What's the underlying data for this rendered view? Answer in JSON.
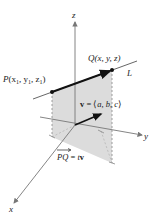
{
  "figure": {
    "axes": {
      "x_label": "x",
      "y_label": "y",
      "z_label": "z"
    },
    "points": {
      "P": {
        "name": "P",
        "coords": "(x",
        "sub1": "1",
        "comma_y": ", y",
        "sub2": "1",
        "comma_z": ", z",
        "sub3": "1",
        "close": ")"
      },
      "Q": {
        "label": "Q(x, y, z)"
      }
    },
    "line_label": "L",
    "vector_label": {
      "v": "v",
      "eq": " = ⟨",
      "a": "a",
      "b": "b",
      "c": "c",
      "sep": ", ",
      "close": "⟩"
    },
    "pq_label": {
      "pq": "PQ",
      "eq": " = ",
      "t": "t",
      "v": "v"
    },
    "colors": {
      "shade": "#d9d9d9",
      "axis": "#777777",
      "line": "#555555",
      "arrow": "#111111"
    }
  }
}
